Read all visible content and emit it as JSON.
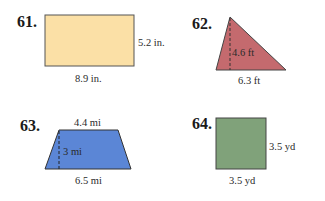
{
  "problems": [
    {
      "number": "61.",
      "shape": "rectangle",
      "fill": "#fbe0a6",
      "labels": {
        "side": "5.2 in.",
        "bottom": "8.9 in."
      }
    },
    {
      "number": "62.",
      "shape": "triangle",
      "fill": "#c46a6e",
      "labels": {
        "height": "4.6 ft",
        "base": "6.3 ft"
      }
    },
    {
      "number": "63.",
      "shape": "trapezoid",
      "fill": "#5b86d6",
      "labels": {
        "top": "4.4 mi",
        "height": "3 mi",
        "bottom": "6.5 mi"
      }
    },
    {
      "number": "64.",
      "shape": "square",
      "fill": "#80a27a",
      "labels": {
        "side": "3.5 yd",
        "bottom": "3.5 yd"
      }
    }
  ]
}
